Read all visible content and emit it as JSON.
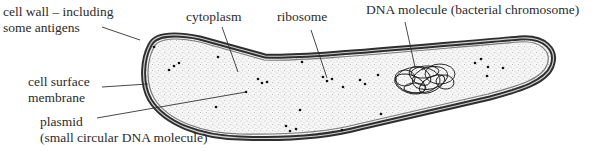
{
  "diagram": {
    "labels": {
      "cell_wall": [
        "cell wall – including",
        "some antigens"
      ],
      "cytoplasm": "cytoplasm",
      "ribosome": "ribosome",
      "dna": "DNA molecule (bacterial chromosome)",
      "cell_surface_membrane": [
        "cell surface",
        "membrane"
      ],
      "plasmid": [
        "plasmid",
        "(small circular DNA molecule)"
      ]
    },
    "colors": {
      "wall_outer": "#3a3a3a",
      "wall_inner": "#9a9a9a",
      "cytoplasm_fill": "#f4f4f4",
      "stipple": "#8a8a8a",
      "ribosome": "#111111",
      "leader": "#333333"
    }
  }
}
